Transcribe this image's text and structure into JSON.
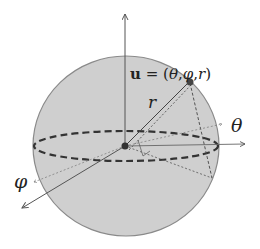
{
  "diagram": {
    "type": "spherical-coordinates",
    "colors": {
      "background": "#ffffff",
      "sphere_fill": "#cfcfcf",
      "sphere_stroke": "#8a8a8a",
      "axis": "#555555",
      "dashed": "#333333",
      "point": "#444444"
    },
    "labels": {
      "point_bold": "u",
      "point_eq": " = (",
      "point_theta": "θ",
      "comma1": ",",
      "point_phi": "φ",
      "comma2": ",",
      "point_r": "r",
      "close": ")",
      "radius": "r",
      "theta_axis": "θ",
      "phi_axis": "φ"
    }
  }
}
